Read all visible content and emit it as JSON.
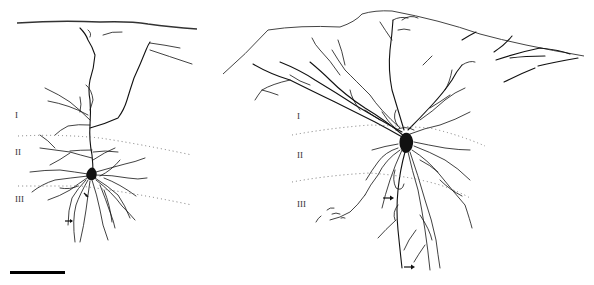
{
  "figure": {
    "colors": {
      "ink": "#111111",
      "background": "#ffffff",
      "boundary": "#777777"
    },
    "left_cell": {
      "layer_labels": [
        {
          "text": "I",
          "x": 15,
          "y": 116
        },
        {
          "text": "II",
          "x": 15,
          "y": 153
        },
        {
          "text": "III",
          "x": 15,
          "y": 199
        }
      ],
      "arrows": [
        {
          "direction": "right",
          "x": 65,
          "y": 221
        }
      ]
    },
    "right_cell": {
      "layer_labels": [
        {
          "text": "I",
          "x": 297,
          "y": 116
        },
        {
          "text": "II",
          "x": 297,
          "y": 155
        },
        {
          "text": "III",
          "x": 297,
          "y": 204
        }
      ],
      "arrows": [
        {
          "direction": "right",
          "x": 383,
          "y": 198
        },
        {
          "direction": "right",
          "x": 404,
          "y": 267
        }
      ]
    },
    "scale_bar": {
      "x": 10,
      "y": 272,
      "width": 55
    }
  }
}
